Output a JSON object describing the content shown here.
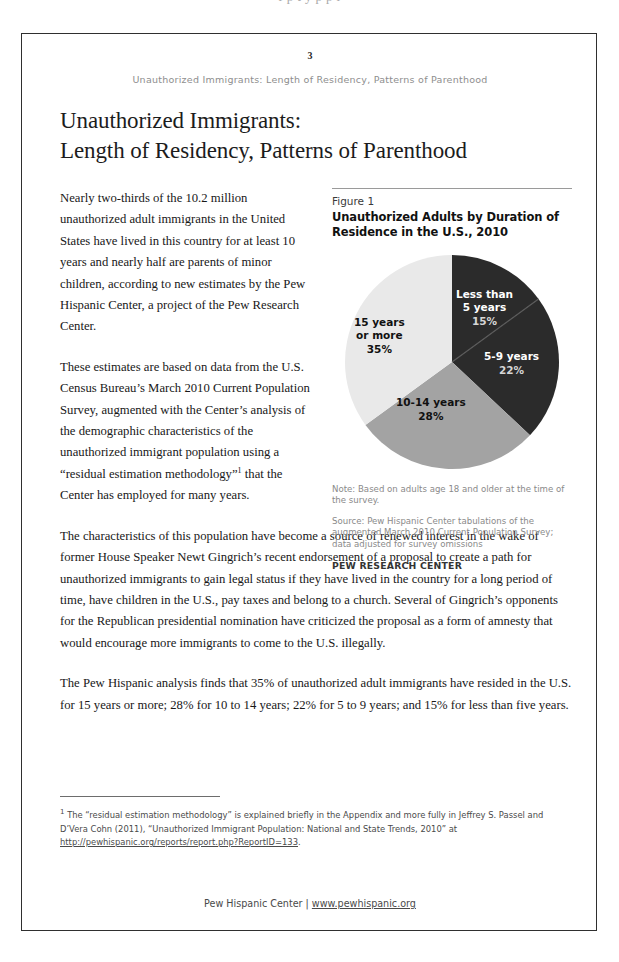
{
  "scan": {
    "ghost_line": "f p t y p p l"
  },
  "page": {
    "number": "3",
    "running_head": "Unauthorized Immigrants: Length of Residency, Patterns of Parenthood",
    "title_line1": "Unauthorized Immigrants:",
    "title_line2": "Length of Residency, Patterns of Parenthood"
  },
  "body": {
    "paragraph1": "Nearly two-thirds of the 10.2 million unauthorized adult immigrants in the United States have lived in this country for at least 10 years and nearly half are parents of minor children, according to new estimates by the Pew Hispanic Center, a project of the Pew Research Center.",
    "paragraph2_part1": "These estimates are based on data from the U.S. Census Bureau’s March 2010 Current Population Survey, augmented with the Center’s analysis of the demographic characteristics of the unauthorized immigrant population using a “residual estimation methodology”",
    "paragraph2_footnote_marker": "1",
    "paragraph2_part2": " that the Center has employed for many years.",
    "paragraph3": "The characteristics of this population have become a source of renewed interest in the wake of former House Speaker Newt Gingrich’s recent endorsement of a proposal to create a path for unauthorized immigrants to gain legal status if they have lived in the country for a long period of time, have children in the U.S., pay taxes and belong to a church. Several of Gingrich’s opponents for the Republican presidential nomination have criticized the proposal as a form of amnesty that would encourage more immigrants to come to the U.S. illegally.",
    "paragraph4": "The Pew Hispanic analysis finds that 35% of unauthorized adult immigrants have resided in the U.S. for 15 years or more; 28% for 10 to 14 years; 22% for 5 to 9 years; and 15% for less than five years."
  },
  "figure": {
    "number_label": "Figure 1",
    "title_line1": "Unauthorized Adults by Duration of",
    "title_line2": "Residence in the U.S., 2010",
    "note": "Note: Based on adults age 18 and older at the time of the survey.",
    "source": "Source: Pew Hispanic Center tabulations of the augmented March 2010 Current Population Survey; data adjusted for survey omissions",
    "organization": "PEW RESEARCH CENTER"
  },
  "chart_data": {
    "type": "pie",
    "title": "Unauthorized Adults by Duration of Residence in the U.S., 2010",
    "categories": [
      "Less than 5 years",
      "5-9 years",
      "10-14 years",
      "15 years or more"
    ],
    "values": [
      15,
      22,
      28,
      35
    ],
    "value_labels": [
      "15%",
      "22%",
      "28%",
      "35%"
    ],
    "label_lines": [
      [
        "Less than",
        "5 years"
      ],
      [
        "5-9 years"
      ],
      [
        "10-14 years"
      ],
      [
        "15 years",
        "or more"
      ]
    ],
    "colors": [
      "#2b2b2b",
      "#2b2b2b",
      "#a3a3a3",
      "#e9e9e9"
    ],
    "unit": "percent",
    "start_angle_deg": 0,
    "direction": "clockwise",
    "legend": "none",
    "labels_inside": true
  },
  "footnote": {
    "marker": "1",
    "text_before_url": " The “residual estimation methodology” is explained briefly in the Appendix and more fully in Jeffrey S. Passel and D’Vera Cohn (2011), “Unauthorized Immigrant Population: National and State Trends, 2010” at ",
    "url": "http://pewhispanic.org/reports/report.php?ReportID=133",
    "text_after_url": "."
  },
  "footer": {
    "organization": "Pew Hispanic Center",
    "separator": " | ",
    "url": "www.pewhispanic.org"
  }
}
